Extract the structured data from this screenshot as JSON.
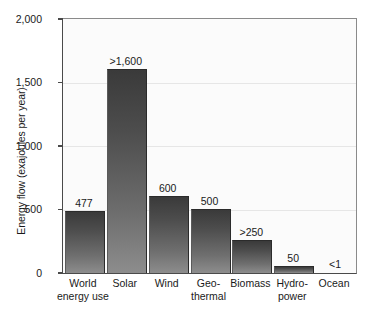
{
  "chart_data": {
    "type": "bar",
    "title": "",
    "xlabel": "",
    "ylabel": "Energy flow (exajoules per year)",
    "ylim": [
      0,
      2000
    ],
    "yticks": [
      "0",
      "500",
      "1,000",
      "1,500",
      "2,000"
    ],
    "ytick_values": [
      0,
      500,
      1000,
      1500,
      2000
    ],
    "grid": true,
    "legend": "none",
    "categories": [
      "World energy use",
      "Solar",
      "Wind",
      "Geo-thermal",
      "Biomass",
      "Hydro-power",
      "Ocean"
    ],
    "category_lines": [
      [
        "World",
        "energy use"
      ],
      [
        "Solar",
        ""
      ],
      [
        "Wind",
        ""
      ],
      [
        "Geo-",
        "thermal"
      ],
      [
        "Biomass",
        ""
      ],
      [
        "Hydro-",
        "power"
      ],
      [
        "Ocean",
        ""
      ]
    ],
    "values": [
      477,
      1600,
      600,
      500,
      250,
      50,
      1
    ],
    "value_labels": [
      "477",
      ">1,600",
      "600",
      "500",
      ">250",
      "50",
      "<1"
    ],
    "bar_color_top": "#3a3a3a",
    "bar_color_bottom": "#8d8d8d",
    "plot_background": "#fbfbfb",
    "axis_color": "#4a4a4a"
  }
}
